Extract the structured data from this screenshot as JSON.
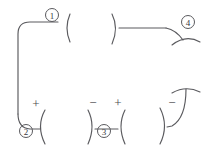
{
  "figure": {
    "title": "",
    "background_color": "#ffffff",
    "stroke_color": "#5a5a5e",
    "label_color": "#3a3a3e",
    "width": 211,
    "height": 147
  },
  "callouts": [
    {
      "id": "callout-1",
      "label": "1",
      "x": 52,
      "y": 15,
      "r": 6.5
    },
    {
      "id": "callout-2",
      "label": "2",
      "x": 26,
      "y": 131,
      "r": 6.5
    },
    {
      "id": "callout-3",
      "label": "3",
      "x": 104,
      "y": 131,
      "r": 6.5
    },
    {
      "id": "callout-4",
      "label": "4",
      "x": 188,
      "y": 22,
      "r": 6.5
    }
  ],
  "polarity_marks": [
    {
      "id": "polarity-plus-left",
      "label": "+",
      "x": 36,
      "y": 103
    },
    {
      "id": "polarity-minus-mid",
      "label": "−",
      "x": 93,
      "y": 102
    },
    {
      "id": "polarity-plus-mid",
      "label": "+",
      "x": 118,
      "y": 102
    },
    {
      "id": "polarity-minus-right",
      "label": "−",
      "x": 172,
      "y": 102
    }
  ],
  "paths": [
    {
      "id": "path-left-rounded-corner",
      "description": "left vertical line rising to rounded corner then horizontal run right",
      "d": "M 58 22 L 30 22 Q 18 22 18 34 L 18 114"
    },
    {
      "id": "path-top-left-arc",
      "description": "open-left parenthesis arc right of callout 1",
      "d": "M 70 14 Q 64 28 70 42"
    },
    {
      "id": "path-top-right-arc",
      "description": "open-right parenthesis arc at start of top-right run",
      "d": "M 112 14 Q 119 28 112 44"
    },
    {
      "id": "path-top-horizontal-run",
      "description": "horizontal line from top-right arc to right descending curve",
      "d": "M 119 28 L 166 28"
    },
    {
      "id": "path-top-right-descend",
      "description": "line descending to the right terminating near callout 4",
      "d": "M 166 28 Q 176 30 183 40"
    },
    {
      "id": "path-top-right-lower-arc",
      "description": "shallow upward arc below callout 4",
      "d": "M 172 45 Q 186 34 200 42"
    },
    {
      "id": "path-bottom-left-elbow",
      "description": "bottom of left vertical curving right into horizontal stub",
      "d": "M 18 114 Q 18 128 30 129 L 40 129"
    },
    {
      "id": "path-bottom-left-arc",
      "description": "open-left arc at bottom-left terminal",
      "d": "M 45 110 Q 36 126 45 144"
    },
    {
      "id": "path-bottom-mid-left-arc",
      "description": "open-right arc on left of bottom-middle pair",
      "d": "M 88 110 Q 96 126 88 144"
    },
    {
      "id": "path-bottom-mid-horizontal",
      "description": "horizontal link between bottom-middle arcs",
      "d": "M 95 129 L 118 129"
    },
    {
      "id": "path-bottom-mid-right-arc",
      "description": "open-left arc on right of bottom-middle pair",
      "d": "M 125 110 Q 117 126 125 144"
    },
    {
      "id": "path-bottom-right-arc",
      "description": "open-right arc at bottom-right",
      "d": "M 160 108 Q 169 126 160 144"
    },
    {
      "id": "path-bottom-right-hook",
      "description": "curve descending from upper right then hooking left to the arc",
      "d": "M 186 89 Q 186 118 172 126 L 167 127"
    },
    {
      "id": "path-bottom-right-top-arc",
      "description": "shallow arc above the bottom-right hook",
      "d": "M 172 93 Q 186 85 200 92"
    }
  ]
}
